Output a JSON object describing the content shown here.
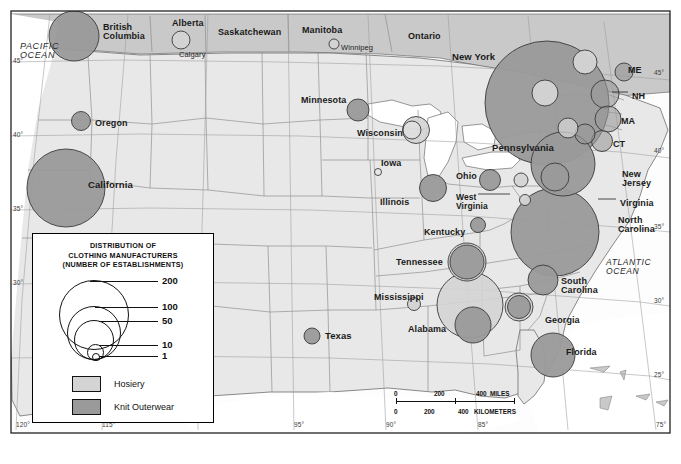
{
  "map": {
    "title_lines": [
      "DISTRIBUTION OF",
      "CLOTHING MANUFACTURERS",
      "(NUMBER OF ESTABLISHMENTS)"
    ],
    "background_color": "#ffffff",
    "land_color": "#e8e8e8",
    "canada_color": "#c9c9c9",
    "water_color": "#ffffff",
    "hosiery_color": "#d4d4d4",
    "knit_color": "#9a9a9a",
    "outline_color": "#555555",
    "border_color": "#333333"
  },
  "legend": {
    "title_lines": [
      "DISTRIBUTION OF",
      "CLOTHING MANUFACTURERS",
      "(NUMBER OF ESTABLISHMENTS)"
    ],
    "scale_values": [
      "200",
      "100",
      "50",
      "10",
      "1"
    ],
    "swatches": [
      {
        "label": "Hosiery",
        "color": "#d4d4d4"
      },
      {
        "label": "Knit Outerwear",
        "color": "#9a9a9a"
      }
    ]
  },
  "scalebar": {
    "miles": {
      "ticks": [
        "0",
        "200",
        "400"
      ],
      "unit": "MILES"
    },
    "kilometers": {
      "ticks": [
        "0",
        "200",
        "400"
      ],
      "unit": "KILOMETERS"
    }
  },
  "oceans": [
    {
      "name": "PACIFIC OCEAN",
      "lines": [
        "PACIFIC",
        "OCEAN"
      ],
      "x": 20,
      "y": 42,
      "size": 9
    },
    {
      "name": "ATLANTIC OCEAN",
      "lines": [
        "ATLANTIC",
        "OCEAN"
      ],
      "x": 606,
      "y": 258,
      "size": 8.5
    }
  ],
  "provinces": [
    {
      "name": "British Columbia",
      "lines": [
        "British",
        "Columbia"
      ],
      "x": 103,
      "y": 23,
      "size": 9
    },
    {
      "name": "Alberta",
      "lines": [
        "Alberta"
      ],
      "x": 172,
      "y": 19,
      "size": 9
    },
    {
      "name": "Saskatchewan",
      "lines": [
        "Saskatchewan"
      ],
      "x": 218,
      "y": 28,
      "size": 9
    },
    {
      "name": "Manitoba",
      "lines": [
        "Manitoba"
      ],
      "x": 302,
      "y": 26,
      "size": 9
    },
    {
      "name": "Ontario",
      "lines": [
        "Ontario"
      ],
      "x": 408,
      "y": 32,
      "size": 9
    }
  ],
  "cities": [
    {
      "name": "Calgary",
      "x": 179,
      "y": 51,
      "size": 7.5
    },
    {
      "name": "Winnipeg",
      "x": 341,
      "y": 44,
      "size": 7.5
    }
  ],
  "states": [
    {
      "name": "New York",
      "lines": [
        "New York"
      ],
      "x": 452,
      "y": 52,
      "size": 9.5
    },
    {
      "name": "Minnesota",
      "lines": [
        "Minnesota"
      ],
      "x": 301,
      "y": 96,
      "size": 9
    },
    {
      "name": "Wisconsin",
      "lines": [
        "Wisconsin"
      ],
      "x": 357,
      "y": 129,
      "size": 9
    },
    {
      "name": "Oregon",
      "lines": [
        "Oregon"
      ],
      "x": 95,
      "y": 119,
      "size": 9
    },
    {
      "name": "California",
      "lines": [
        "California"
      ],
      "x": 88,
      "y": 180,
      "size": 9.5
    },
    {
      "name": "Iowa",
      "lines": [
        "Iowa"
      ],
      "x": 381,
      "y": 159,
      "size": 9
    },
    {
      "name": "Illinois",
      "lines": [
        "Illinois"
      ],
      "x": 380,
      "y": 198,
      "size": 9
    },
    {
      "name": "Ohio",
      "lines": [
        "Ohio"
      ],
      "x": 456,
      "y": 172,
      "size": 9
    },
    {
      "name": "Pennsylvania",
      "lines": [
        "Pennsylvania"
      ],
      "x": 492,
      "y": 143,
      "size": 9.5
    },
    {
      "name": "West Virginia",
      "lines": [
        "West",
        "Virginia"
      ],
      "x": 456,
      "y": 193,
      "size": 8.5
    },
    {
      "name": "Kentucky",
      "lines": [
        "Kentucky"
      ],
      "x": 424,
      "y": 228,
      "size": 9
    },
    {
      "name": "Tennessee",
      "lines": [
        "Tennessee"
      ],
      "x": 396,
      "y": 258,
      "size": 9
    },
    {
      "name": "Mississippi",
      "lines": [
        "Mississippi"
      ],
      "x": 374,
      "y": 293,
      "size": 9
    },
    {
      "name": "Alabama",
      "lines": [
        "Alabama"
      ],
      "x": 408,
      "y": 325,
      "size": 9
    },
    {
      "name": "Texas",
      "lines": [
        "Texas"
      ],
      "x": 325,
      "y": 331,
      "size": 9.5
    },
    {
      "name": "Georgia",
      "lines": [
        "Georgia"
      ],
      "x": 545,
      "y": 316,
      "size": 9
    },
    {
      "name": "South Carolina",
      "lines": [
        "South",
        "Carolina"
      ],
      "x": 561,
      "y": 277,
      "size": 9
    },
    {
      "name": "North Carolina",
      "lines": [
        "North",
        "Carolina"
      ],
      "x": 618,
      "y": 216,
      "size": 9
    },
    {
      "name": "Virginia",
      "lines": [
        "Virginia"
      ],
      "x": 620,
      "y": 199,
      "size": 9
    },
    {
      "name": "New Jersey",
      "lines": [
        "New",
        "Jersey"
      ],
      "x": 622,
      "y": 170,
      "size": 9
    },
    {
      "name": "Florida",
      "lines": [
        "Florida"
      ],
      "x": 566,
      "y": 348,
      "size": 9
    },
    {
      "name": "Maine",
      "lines": [
        "ME"
      ],
      "x": 628,
      "y": 66,
      "size": 9
    },
    {
      "name": "New Hampshire",
      "lines": [
        "NH"
      ],
      "x": 632,
      "y": 92,
      "size": 9
    },
    {
      "name": "Massachusetts",
      "lines": [
        "MA"
      ],
      "x": 621,
      "y": 117,
      "size": 9
    },
    {
      "name": "Connecticut",
      "lines": [
        "CT"
      ],
      "x": 613,
      "y": 140,
      "size": 9
    }
  ],
  "graticule": {
    "left_labels": [
      "45",
      "40",
      "35",
      "30"
    ],
    "right_labels": [
      "45",
      "40",
      "35",
      "30",
      "25"
    ],
    "bottom_labels": [
      "120",
      "115",
      "95",
      "90",
      "85",
      "75"
    ],
    "degree_symbol": "°"
  },
  "chart_data": {
    "type": "scatter",
    "title": "DISTRIBUTION OF CLOTHING MANUFACTURERS (NUMBER OF ESTABLISHMENTS)",
    "legend": [
      "Hosiery",
      "Knit Outerwear"
    ],
    "size_scale": [
      1,
      10,
      50,
      100,
      200
    ],
    "points": [
      {
        "region": "British Columbia",
        "series": "Knit Outerwear",
        "value": 55,
        "x": 74,
        "y": 36,
        "r": 25
      },
      {
        "region": "Alberta (Calgary)",
        "series": "Hosiery",
        "value": 12,
        "x": 181,
        "y": 40,
        "r": 9
      },
      {
        "region": "Manitoba (Winnipeg)",
        "series": "Hosiery",
        "value": 4,
        "x": 334,
        "y": 44,
        "r": 5
      },
      {
        "region": "Oregon",
        "series": "Knit Outerwear",
        "value": 13,
        "x": 81,
        "y": 121,
        "r": 9.5
      },
      {
        "region": "California",
        "series": "Knit Outerwear",
        "value": 130,
        "x": 66,
        "y": 188,
        "r": 39
      },
      {
        "region": "Minnesota",
        "series": "Knit Outerwear",
        "value": 17,
        "x": 358,
        "y": 110,
        "r": 11
      },
      {
        "region": "Wisconsin-outer",
        "series": "Hosiery",
        "value": 22,
        "x": 416,
        "y": 130,
        "r": 13.5
      },
      {
        "region": "Wisconsin-inner",
        "series": "Knit Outerwear",
        "value": 12,
        "x": 412,
        "y": 130,
        "r": 9
      },
      {
        "region": "Iowa",
        "series": "Hosiery",
        "value": 2,
        "x": 378,
        "y": 172,
        "r": 3.5
      },
      {
        "region": "Illinois",
        "series": "Knit Outerwear",
        "value": 22,
        "x": 433,
        "y": 188,
        "r": 13.5
      },
      {
        "region": "Ohio",
        "series": "Knit Outerwear",
        "value": 15,
        "x": 490,
        "y": 180,
        "r": 10.5
      },
      {
        "region": "West Virginia",
        "series": "Hosiery",
        "value": 4,
        "x": 525,
        "y": 200,
        "r": 5.5
      },
      {
        "region": "Kentucky",
        "series": "Knit Outerwear",
        "value": 9,
        "x": 478,
        "y": 225,
        "r": 7.5
      },
      {
        "region": "Tennessee-outer",
        "series": "Hosiery",
        "value": 38,
        "x": 467,
        "y": 262,
        "r": 19
      },
      {
        "region": "Tennessee-inner",
        "series": "Knit Outerwear",
        "value": 32,
        "x": 467,
        "y": 262,
        "r": 17
      },
      {
        "region": "Mississippi",
        "series": "Hosiery",
        "value": 5,
        "x": 414,
        "y": 304,
        "r": 6.5
      },
      {
        "region": "Alabama-outer",
        "series": "Hosiery",
        "value": 95,
        "x": 470,
        "y": 305,
        "r": 33
      },
      {
        "region": "Alabama-inner",
        "series": "Knit Outerwear",
        "value": 35,
        "x": 473,
        "y": 325,
        "r": 18
      },
      {
        "region": "Texas",
        "series": "Knit Outerwear",
        "value": 10,
        "x": 312,
        "y": 336,
        "r": 8
      },
      {
        "region": "New York",
        "series": "Knit Outerwear",
        "value": 190,
        "x": 547,
        "y": 103,
        "r": 62
      },
      {
        "region": "Pennsylvania",
        "series": "Knit Outerwear",
        "value": 100,
        "x": 563,
        "y": 164,
        "r": 32
      },
      {
        "region": "Pennsylvania-inner",
        "series": "Knit Outerwear",
        "value": 30,
        "x": 555,
        "y": 177,
        "r": 14
      },
      {
        "region": "New England-upstate",
        "series": "Hosiery",
        "value": 16,
        "x": 585,
        "y": 62,
        "r": 12
      },
      {
        "region": "Upstate NY",
        "series": "Hosiery",
        "value": 18,
        "x": 545,
        "y": 93,
        "r": 13
      },
      {
        "region": "Maine",
        "series": "Knit Outerwear",
        "value": 11,
        "x": 624,
        "y": 72,
        "r": 9
      },
      {
        "region": "New Hampshire",
        "series": "Knit Outerwear",
        "value": 22,
        "x": 605,
        "y": 94,
        "r": 14
      },
      {
        "region": "Massachusetts",
        "series": "Knit Outerwear",
        "value": 20,
        "x": 608,
        "y": 119,
        "r": 13
      },
      {
        "region": "Connecticut",
        "series": "Knit Outerwear",
        "value": 14,
        "x": 602,
        "y": 141,
        "r": 10.5
      },
      {
        "region": "New Jersey",
        "series": "Knit Outerwear",
        "value": 14,
        "x": 585,
        "y": 134,
        "r": 10
      },
      {
        "region": "Virginia",
        "series": "Hosiery",
        "value": 14,
        "x": 568,
        "y": 128,
        "r": 10
      },
      {
        "region": "North Carolina",
        "series": "Knit Outerwear",
        "value": 150,
        "x": 555,
        "y": 232,
        "r": 44
      },
      {
        "region": "South Carolina",
        "series": "Knit Outerwear",
        "value": 26,
        "x": 543,
        "y": 280,
        "r": 15
      },
      {
        "region": "Georgia",
        "series": "Knit Outerwear",
        "value": 22,
        "x": 519,
        "y": 307,
        "r": 14
      },
      {
        "region": "Florida",
        "series": "Knit Outerwear",
        "value": 30,
        "x": 553,
        "y": 355,
        "r": 22
      },
      {
        "region": "Maryland",
        "series": "Hosiery",
        "value": 8,
        "x": 521,
        "y": 180,
        "r": 7
      }
    ]
  }
}
